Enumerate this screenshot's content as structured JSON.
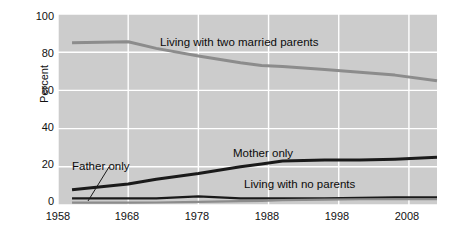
{
  "chart_data": {
    "type": "line",
    "title": "",
    "subtitle": "",
    "xlabel": "",
    "ylabel": "Percent",
    "xlim": [
      1958,
      2012
    ],
    "ylim": [
      0,
      100
    ],
    "grid": true,
    "grid_color": "#ffffff",
    "plot_background": "#cccccc",
    "legend_position": "inline-annotations",
    "x_ticks": [
      1958,
      1968,
      1978,
      1988,
      1998,
      2008
    ],
    "x_tick_labels": [
      "1958",
      "1968",
      "1978",
      "1988",
      "1998",
      "2008"
    ],
    "y_ticks": [
      0,
      20,
      40,
      60,
      80,
      100
    ],
    "y_tick_labels": [
      "0",
      "20",
      "40",
      "60",
      "80",
      "100"
    ],
    "series": [
      {
        "name": "Living with two married parents",
        "color": "#8c8c8c",
        "width": 3.0,
        "x": [
          1960,
          1968,
          1972,
          1978,
          1984,
          1987,
          1990,
          1996,
          2001,
          2006,
          2012
        ],
        "values": [
          85,
          85.5,
          82,
          78,
          74.5,
          73,
          72.5,
          71,
          69.5,
          68,
          65
        ]
      },
      {
        "name": "Mother only",
        "color": "#1a1a1a",
        "width": 3.0,
        "x": [
          1960,
          1968,
          1972,
          1978,
          1984,
          1987,
          1990,
          1996,
          2001,
          2006,
          2012
        ],
        "values": [
          8,
          11,
          13.5,
          16.5,
          20,
          21.5,
          23,
          23.5,
          23.5,
          24,
          25
        ]
      },
      {
        "name": "Living with no parents",
        "color": "#1a1a1a",
        "width": 2.2,
        "x": [
          1960,
          1968,
          1972,
          1978,
          1984,
          1987,
          1990,
          1996,
          2001,
          2006,
          2012
        ],
        "values": [
          3.5,
          3.5,
          3.5,
          4.5,
          3.5,
          3.5,
          3.5,
          3.5,
          3.7,
          4,
          4
        ]
      },
      {
        "name": "Father only",
        "color": "#8c8c8c",
        "width": 2.2,
        "x": [
          1960,
          1968,
          1972,
          1978,
          1984,
          1987,
          1990,
          1996,
          2001,
          2006,
          2012
        ],
        "values": [
          1.2,
          1.2,
          1.3,
          1.6,
          2,
          2.2,
          2.5,
          2.8,
          3,
          3,
          3
        ]
      }
    ],
    "annotations": [
      {
        "text": "Living with two married parents",
        "x": 1978,
        "y": 88
      },
      {
        "text": "Mother only",
        "x": 1988,
        "y": 31
      },
      {
        "text": "Father only",
        "x": 1962,
        "y": 18,
        "has_leader_line": true
      },
      {
        "text": "Living with no parents",
        "x": 1990,
        "y": 13
      }
    ]
  },
  "axis": {
    "y_title": "Percent",
    "y_tick_labels": [
      "100",
      "80",
      "60",
      "40",
      "20",
      "0"
    ],
    "x_tick_labels": [
      "1958",
      "1968",
      "1978",
      "1988",
      "1998",
      "2008"
    ]
  },
  "labels": {
    "married": "Living with two married parents",
    "mother": "Mother only",
    "father": "Father only",
    "noparents": "Living with no parents"
  },
  "colors": {
    "plot_bg": "#cccccc",
    "page_bg": "#ffffff",
    "grid": "#ffffff",
    "dark_series": "#1a1a1a",
    "gray_series": "#8c8c8c",
    "text": "#111111"
  }
}
